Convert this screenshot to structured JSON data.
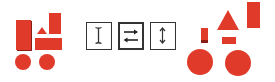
{
  "figure": {
    "colors": {
      "shape": "#e03a2a",
      "shape_shadow": "#8a1e15",
      "box_border": "#333333"
    },
    "left_group": {
      "label": "source-shapes",
      "shapes": [
        "tall-rect",
        "triangle",
        "wide-rect",
        "tall-rect-right",
        "circle",
        "circle"
      ]
    },
    "operations": [
      {
        "icon": "i-beam-icon",
        "meaning": "vertical-stretch-cursor"
      },
      {
        "icon": "swap-arrows-icon",
        "meaning": "swap-left-right"
      },
      {
        "icon": "vertical-double-arrow-icon",
        "meaning": "vertical-resize"
      }
    ],
    "right_group": {
      "label": "result-shapes",
      "shapes": [
        "small-rect",
        "triangle",
        "tall-rect",
        "small-wide-rect",
        "circle",
        "circle"
      ]
    }
  }
}
